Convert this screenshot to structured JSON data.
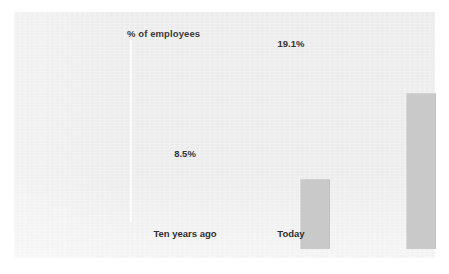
{
  "chart_data": {
    "type": "bar",
    "title": "",
    "subtitle": "",
    "xlabel": "",
    "ylabel": "% of employees",
    "categories": [
      "Ten years ago",
      "Today"
    ],
    "values": [
      8.5,
      19.1
    ],
    "value_labels": [
      "8.5%",
      "19.1%"
    ],
    "units": "percent",
    "ylim": [
      0,
      24
    ],
    "grid": false,
    "legend": "none",
    "series": [
      {
        "name": "% of employees",
        "values": [
          8.5,
          19.1
        ]
      }
    ],
    "colors": {
      "bar_fill": "#c9c9c9",
      "panel_background": "#eeeeee",
      "page_background": "#ffffff",
      "text": "#333333",
      "axis_line": "#fbfbfb"
    }
  },
  "figure": {
    "axis_title": "% of employees",
    "bars": [
      {
        "category": "Ten years ago",
        "value_label": "8.5%"
      },
      {
        "category": "Today",
        "value_label": "19.1%"
      }
    ]
  }
}
